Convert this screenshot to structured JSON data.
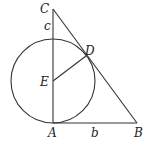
{
  "diagram": {
    "points": {
      "A": {
        "label": "A",
        "x": 53,
        "y": 123
      },
      "B": {
        "label": "B",
        "x": 137,
        "y": 123
      },
      "C": {
        "label": "C",
        "x": 53,
        "y": 9
      },
      "D": {
        "label": "D",
        "x": 86,
        "y": 56
      },
      "E": {
        "label": "E",
        "x": 53,
        "y": 81
      }
    },
    "segment_labels": {
      "c": "c",
      "b": "b"
    },
    "circle": {
      "center": "E",
      "radius": 42
    }
  }
}
